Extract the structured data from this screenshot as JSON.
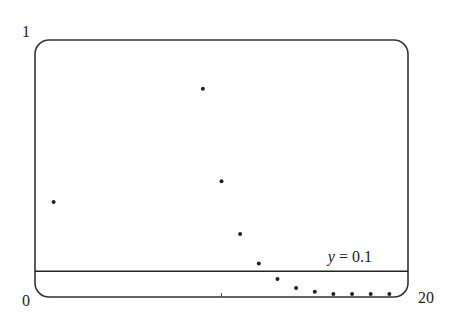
{
  "chart_data": {
    "type": "scatter",
    "title": "",
    "xlabel": "",
    "ylabel": "",
    "xlim": [
      0,
      20
    ],
    "ylim": [
      0,
      1
    ],
    "grid": false,
    "tick_labels": {
      "y_top": "1",
      "y_bottom": "0",
      "x_right": "20"
    },
    "x": [
      1,
      9,
      10,
      11,
      12,
      13,
      14,
      15,
      16,
      17,
      18,
      19
    ],
    "y": [
      0.37,
      0.81,
      0.45,
      0.245,
      0.13,
      0.07,
      0.035,
      0.02,
      0.012,
      0.01,
      0.01,
      0.01
    ],
    "reference_line": {
      "y": 0.1,
      "label": "y = 0.1"
    },
    "x_tick_marks": [
      10
    ]
  },
  "colors": {
    "ink": "#222222",
    "background": "#ffffff"
  }
}
